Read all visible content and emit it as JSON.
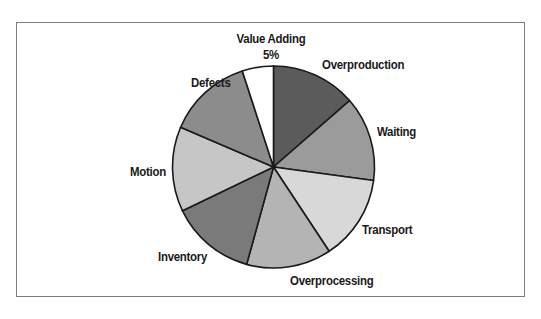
{
  "chart_data": {
    "type": "pie",
    "title": "",
    "start_angle_deg": 0,
    "direction": "clockwise",
    "slices": [
      {
        "label": "Overproduction",
        "value": 13.57,
        "color": "#5b5b5b"
      },
      {
        "label": "Waiting",
        "value": 13.57,
        "color": "#9b9b9b"
      },
      {
        "label": "Transport",
        "value": 13.57,
        "color": "#d8d8d8"
      },
      {
        "label": "Overprocessing",
        "value": 13.57,
        "color": "#b4b4b4"
      },
      {
        "label": "Inventory",
        "value": 13.57,
        "color": "#7a7a7a"
      },
      {
        "label": "Motion",
        "value": 13.57,
        "color": "#c6c6c6"
      },
      {
        "label": "Defects",
        "value": 13.57,
        "color": "#8c8c8c"
      },
      {
        "label": "Value Adding",
        "value": 5,
        "color": "#ffffff",
        "value_label": "5%"
      }
    ],
    "legend": "none (labels placed beside slices)"
  },
  "labels": {
    "overproduction": "Overproduction",
    "waiting": "Waiting",
    "transport": "Transport",
    "overprocessing": "Overprocessing",
    "inventory": "Inventory",
    "motion": "Motion",
    "defects": "Defects",
    "value_adding": "Value Adding",
    "value_adding_pct": "5%"
  }
}
